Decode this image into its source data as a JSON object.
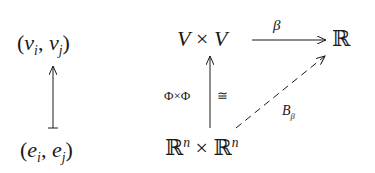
{
  "left_diagram": {
    "top_node": {
      "open": "(",
      "a": "v",
      "a_sub": "i",
      "sep": ", ",
      "b": "v",
      "b_sub": "j",
      "close": ")"
    },
    "bottom_node": {
      "open": "(",
      "a": "e",
      "a_sub": "i",
      "sep": ", ",
      "b": "e",
      "b_sub": "j",
      "close": ")"
    },
    "arrow": "maps-to (bottom to top)"
  },
  "right_diagram": {
    "top_left_node": {
      "a": "V",
      "op": "×",
      "b": "V"
    },
    "top_right_node": "ℝ",
    "bottom_left_node": {
      "a": "ℝ",
      "a_sup": "n",
      "op": "×",
      "b": "ℝ",
      "b_sup": "n"
    },
    "top_arrow_label": "β",
    "vertical_arrow_label_left": "Φ×Φ",
    "vertical_arrow_label_right": "≅",
    "diagonal_arrow_label": {
      "main": "B",
      "sub": "β"
    },
    "diagonal_arrow_style": "dashed"
  },
  "colors": {
    "ink": "#1a1a1a",
    "background": "#ffffff"
  }
}
